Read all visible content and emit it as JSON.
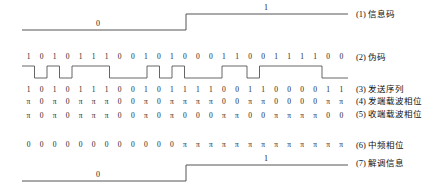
{
  "figure": {
    "type": "dsss-bpsk-timing-diagram",
    "chip_count": 26,
    "plot_left_px": 22,
    "plot_right_px": 348,
    "label_left_px": 356,
    "line_color": "#555555",
    "text_color": "#1a1a1a"
  },
  "rows": [
    {
      "id": "info-code",
      "number": "(1)",
      "label": "(1) 信息码",
      "kind": "waveform",
      "bit_labels": [
        "0",
        "1"
      ],
      "levels": [
        0,
        1
      ],
      "transition_chip": 13
    },
    {
      "id": "pn-code",
      "number": "(2)",
      "label": "(2) 伪码",
      "kind": "digits+waveform",
      "digits": [
        "1",
        "0",
        "1",
        "0",
        "1",
        "1",
        "1",
        "0",
        "0",
        "1",
        "0",
        "1",
        "0",
        "0",
        "0",
        "1",
        "1",
        "0",
        "0",
        "1",
        "1",
        "1",
        "1",
        "0",
        "0"
      ]
    },
    {
      "id": "tx-sequence",
      "number": "(3)",
      "label": "(3) 发送序列",
      "kind": "digits",
      "digits": [
        "1",
        "0",
        "1",
        "0",
        "1",
        "1",
        "1",
        "0",
        "0",
        "1",
        "0",
        "1",
        "1",
        "1",
        "1",
        "0",
        "0",
        "1",
        "1",
        "0",
        "0",
        "0",
        "0",
        "1",
        "1"
      ]
    },
    {
      "id": "tx-carrier-phase",
      "number": "(4)",
      "label": "(4) 发端载波相位",
      "kind": "digits",
      "digits": [
        "π",
        "0",
        "π",
        "0",
        "π",
        "π",
        "π",
        "0",
        "0",
        "π",
        "0",
        "π",
        "π",
        "π",
        "π",
        "0",
        "0",
        "π",
        "π",
        "0",
        "0",
        "0",
        "0",
        "π",
        "π"
      ]
    },
    {
      "id": "rx-carrier-phase",
      "number": "(5)",
      "label": "(5) 收端载波相位",
      "kind": "digits",
      "digits": [
        "π",
        "0",
        "π",
        "0",
        "π",
        "π",
        "π",
        "0",
        "0",
        "π",
        "0",
        "π",
        "0",
        "0",
        "0",
        "π",
        "π",
        "0",
        "0",
        "π",
        "π",
        "π",
        "π",
        "0",
        "0"
      ]
    },
    {
      "id": "if-phase",
      "number": "(6)",
      "label": "(6) 中频相位",
      "kind": "digits",
      "digits": [
        "0",
        "0",
        "0",
        "0",
        "0",
        "0",
        "0",
        "0",
        "0",
        "0",
        "0",
        "0",
        "π",
        "π",
        "π",
        "π",
        "π",
        "π",
        "π",
        "π",
        "π",
        "π",
        "π",
        "π",
        "π"
      ]
    },
    {
      "id": "demodulated-info",
      "number": "(7)",
      "label": "(7) 解调信息",
      "kind": "waveform",
      "bit_labels": [
        "0",
        "1"
      ],
      "levels": [
        0,
        1
      ],
      "transition_chip": 13
    }
  ]
}
